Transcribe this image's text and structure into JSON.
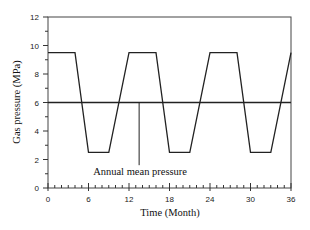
{
  "chart_data": {
    "type": "line",
    "title": "",
    "xlabel": "Time (Month)",
    "ylabel": "Gas pressure (MPa)",
    "xlim": [
      0,
      36
    ],
    "ylim": [
      0,
      12
    ],
    "xticks": [
      0,
      6,
      12,
      18,
      24,
      30,
      36
    ],
    "yticks": [
      0,
      2,
      4,
      6,
      8,
      10,
      12
    ],
    "x_minor_step": 1,
    "y_minor_step": 1,
    "grid": false,
    "legend": null,
    "series": [
      {
        "name": "Gas pressure",
        "color": "#222222",
        "x": [
          0,
          4,
          6,
          9,
          12,
          16,
          18,
          21,
          24,
          28,
          30,
          33,
          36
        ],
        "y": [
          9.5,
          9.5,
          2.5,
          2.5,
          9.5,
          9.5,
          2.5,
          2.5,
          9.5,
          9.5,
          2.5,
          2.5,
          9.5
        ]
      },
      {
        "name": "Annual mean pressure",
        "color": "#222222",
        "x": [
          0,
          36
        ],
        "y": [
          6,
          6
        ]
      }
    ],
    "annotations": [
      {
        "text": "Annual mean pressure",
        "x": 13.5,
        "y": 6,
        "leader_to_y": 1.6
      }
    ]
  }
}
